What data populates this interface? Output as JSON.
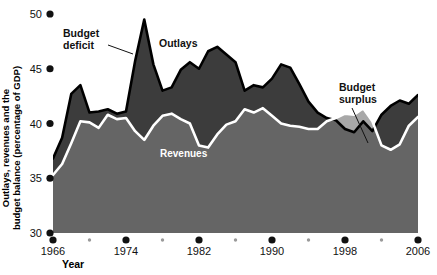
{
  "chart_data": {
    "type": "area",
    "title": "",
    "xlabel": "Year",
    "ylabel": "Outlays, revenues and the budget balance (percentage of GDP)",
    "ylabel_line1": "Outlays, revenues and the",
    "ylabel_line2": "budget balance (percentage of GDP)",
    "xlim": [
      1966,
      2006
    ],
    "ylim": [
      30,
      50
    ],
    "yticks": [
      30,
      35,
      40,
      45,
      50
    ],
    "ytick_labels": [
      "30",
      "35",
      "40",
      "45",
      "50"
    ],
    "xticks": [
      1966,
      1974,
      1982,
      1990,
      1998,
      2006
    ],
    "xtick_labels": [
      "1966",
      "1974",
      "1982",
      "1990",
      "1998",
      "2006"
    ],
    "xminor_ticks": [
      1970,
      1978,
      1986,
      1994,
      2002
    ],
    "grid": false,
    "legend_position": "inline-annotations",
    "annotations": [
      {
        "text": "Budget deficit",
        "line1": "Budget",
        "line2": "deficit",
        "x": 1971.0,
        "y": 48.6
      },
      {
        "text": "Outlays",
        "x": 1978.0,
        "y": 47.6
      },
      {
        "text": "Revenues",
        "x": 1978.5,
        "y": 38.2
      },
      {
        "text": "Budget surplus",
        "line1": "Budget",
        "line2": "surplus",
        "x": 2001.6,
        "y": 44.6
      }
    ],
    "x": [
      1966,
      1967,
      1968,
      1969,
      1970,
      1971,
      1972,
      1973,
      1974,
      1975,
      1976,
      1977,
      1978,
      1979,
      1980,
      1981,
      1982,
      1983,
      1984,
      1985,
      1986,
      1987,
      1988,
      1989,
      1990,
      1991,
      1992,
      1993,
      1994,
      1995,
      1996,
      1997,
      1998,
      1999,
      2000,
      2001,
      2002,
      2003,
      2004,
      2005,
      2006
    ],
    "series": [
      {
        "name": "Outlays",
        "color": "#3c3c3c",
        "values": [
          36.8,
          38.7,
          42.7,
          43.5,
          41.0,
          41.1,
          41.3,
          40.9,
          41.1,
          45.7,
          49.5,
          45.4,
          43.0,
          43.3,
          44.9,
          45.6,
          45.0,
          46.6,
          47.0,
          46.3,
          45.6,
          43.0,
          43.5,
          43.3,
          44.1,
          45.4,
          45.1,
          43.6,
          42.0,
          41.0,
          40.5,
          40.3,
          39.5,
          39.2,
          40.2,
          39.3,
          40.8,
          41.6,
          42.1,
          41.8,
          42.6
        ]
      },
      {
        "name": "Revenues",
        "color": "#ffffff",
        "values": [
          35.3,
          36.3,
          38.2,
          40.2,
          40.1,
          39.6,
          40.8,
          40.4,
          40.5,
          39.3,
          38.5,
          39.8,
          40.7,
          40.9,
          40.4,
          40.0,
          38.0,
          37.8,
          39.0,
          39.9,
          40.2,
          41.3,
          41.0,
          41.4,
          40.7,
          40.0,
          39.8,
          39.7,
          39.5,
          39.5,
          40.2,
          40.5,
          40.9,
          40.8,
          41.4,
          40.2,
          38.0,
          37.6,
          38.1,
          39.8,
          40.6
        ]
      }
    ],
    "colors": {
      "outlays_fill": "#3c3c3c",
      "deficit_fill": "#3c3c3c",
      "revenues_fill": "#656565",
      "surplus_fill": "#a8a8a8",
      "revenue_line": "#ffffff",
      "outlay_line": "#000000",
      "background": "#ffffff",
      "text": "#111111"
    }
  },
  "axes": {
    "y_label_line1": "Outlays, revenues and the",
    "y_label_line2": "budget balance (percentage of GDP)",
    "x_label": "Year"
  }
}
